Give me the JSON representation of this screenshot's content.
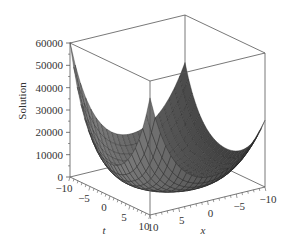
{
  "chart_data": {
    "type": "surface3d",
    "title": "",
    "xlabel": "x",
    "ylabel": "t",
    "zlabel": "Solution",
    "x_range": [
      -10,
      10
    ],
    "t_range": [
      -10,
      10
    ],
    "z_range": [
      0,
      60000
    ],
    "x_ticks": [
      "10",
      "5",
      "0",
      "-5",
      "-10"
    ],
    "t_ticks": [
      "-10",
      "-5",
      "0",
      "5",
      "10"
    ],
    "z_ticks": [
      "0",
      "10000",
      "20000",
      "30000",
      "40000",
      "50000",
      "60000"
    ],
    "z_tick_values": [
      0,
      10000,
      20000,
      30000,
      40000,
      50000,
      60000
    ],
    "corner_values": {
      "t=-10,x=10": 60000,
      "t=10,x=10": 52000,
      "t=-10,x=-10": 38000,
      "t=10,x=-10": 29000
    },
    "surface_description": "Bowl-shaped surface rising to peaks at the four corners of the (x,t) domain, minimum near the center",
    "grid": false,
    "box": true,
    "surface_color": "#4a4a4a",
    "mesh_color": "#222222"
  },
  "axes": {
    "z_title": "Solution",
    "t_title": "t",
    "x_title": "x"
  }
}
